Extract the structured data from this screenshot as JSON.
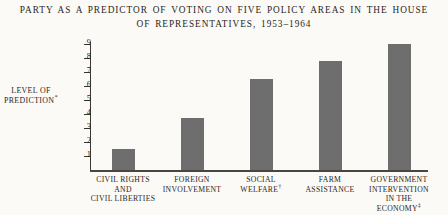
{
  "title": {
    "line1": "Party as a Predictor of Voting on Five Policy Areas in the House",
    "line2": "of Representatives, 1953–1964"
  },
  "axis": {
    "y_caption_line1": "Level of",
    "y_caption_line2": "Prediction",
    "y_caption_marker": "*",
    "ticks": [
      ".9",
      ".8",
      ".7",
      ".6",
      ".5",
      ".4",
      ".3",
      ".2",
      ".1"
    ]
  },
  "colors": {
    "bar": "#6e6e6e",
    "axis": "#3b3733",
    "background": "#fbfaf7",
    "text": "#2a2622"
  },
  "chart_data": {
    "type": "bar",
    "title": "Party as a Predictor of Voting on Five Policy Areas in the House of Representatives, 1953–1964",
    "xlabel": "",
    "ylabel": "Level of Prediction*",
    "ylim": [
      0,
      0.95
    ],
    "grid": false,
    "legend": "none",
    "ytick_labels": [
      ".1",
      ".2",
      ".3",
      ".4",
      ".5",
      ".6",
      ".7",
      ".8",
      ".9"
    ],
    "ytick_values": [
      0.1,
      0.2,
      0.3,
      0.4,
      0.5,
      0.6,
      0.7,
      0.8,
      0.9
    ],
    "categories": [
      "Civil Rights and Civil Liberties",
      "Foreign Involvement",
      "Social Welfare†",
      "Farm Assistance",
      "Government Intervention in the Economy‡"
    ],
    "values": [
      0.15,
      0.375,
      0.65,
      0.78,
      0.9
    ],
    "bars": [
      {
        "label_lines": [
          "Civil Rights",
          "and",
          "Civil Liberties"
        ],
        "marker": "",
        "value": 0.15
      },
      {
        "label_lines": [
          "Foreign",
          "Involvement"
        ],
        "marker": "",
        "value": 0.375
      },
      {
        "label_lines": [
          "Social",
          "Welfare"
        ],
        "marker": "†",
        "value": 0.65
      },
      {
        "label_lines": [
          "Farm",
          "Assistance"
        ],
        "marker": "",
        "value": 0.78
      },
      {
        "label_lines": [
          "Government",
          "Intervention",
          "in the",
          "Economy"
        ],
        "marker": "‡",
        "value": 0.9
      }
    ]
  }
}
